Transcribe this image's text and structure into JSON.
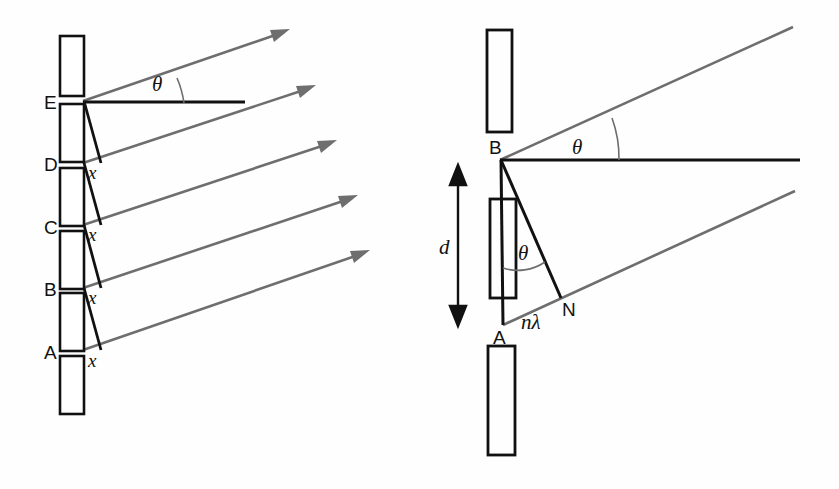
{
  "figure": {
    "colors": {
      "slit_stroke": "#111111",
      "ray_gray": "#6e6e6e",
      "line_black": "#111111",
      "background": "#fefefe"
    }
  },
  "left_panel": {
    "name": "multi-slit-path-difference",
    "slit_labels": [
      "A",
      "B",
      "C",
      "D",
      "E"
    ],
    "path_difference_labels": [
      "x",
      "x",
      "x",
      "x",
      "x"
    ],
    "angle_label": "θ",
    "bar_count": 6,
    "ray_count": 5,
    "description": "Five slits A–E on a grating; successive rays leaving at angle theta acquire an extra path length x per slit."
  },
  "right_panel": {
    "name": "two-slit-geometry",
    "slit_labels": [
      "A",
      "B"
    ],
    "foot_label": "N",
    "spacing_label": "d",
    "path_difference_label": "nλ",
    "angle_labels": [
      "θ",
      "θ"
    ],
    "bar_count": 3,
    "ray_count": 2,
    "description": "Slit separation d; the path difference AN = nλ subtends angle theta, giving d sin(theta) = nλ."
  },
  "symbols": {
    "theta": "θ",
    "lambda": "λ",
    "x": "x",
    "d": "d",
    "n_lambda": "nλ",
    "N": "N"
  }
}
